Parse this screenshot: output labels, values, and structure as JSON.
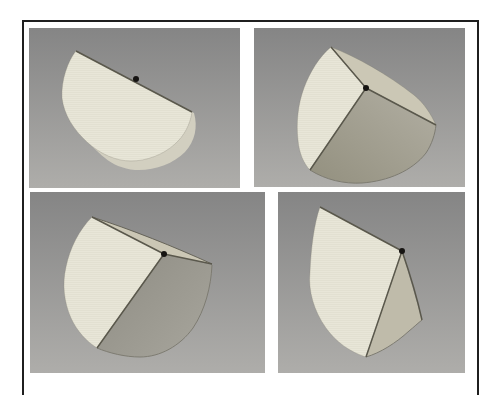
{
  "figure": {
    "panels": [
      {
        "id": "top-left",
        "stage": "disc folded flat in half",
        "marked_point": true
      },
      {
        "id": "top-right",
        "stage": "half-opened cone with three visible faces",
        "marked_point": true
      },
      {
        "id": "bottom-left",
        "stage": "disc with one sector folded upward",
        "marked_point": true
      },
      {
        "id": "bottom-right",
        "stage": "tightly folded narrow cone",
        "marked_point": true
      }
    ],
    "colors": {
      "page_bg": "#ffffff",
      "frame": "#1f1f1f",
      "panel_bg_top": "#858585",
      "panel_bg_bottom": "#aeadaa",
      "face_bright": "#ebe9db",
      "underside": "#d2cfc0",
      "flap_light": "#cbc7b5",
      "flap_mid": "#bfbbaa",
      "cone_inner_dark": "#93907f",
      "cone_inner_light": "#b2afa3",
      "back_half_dark": "#8e8c83",
      "back_half_light": "#a4a299",
      "fold_line": "#5a584c",
      "rim_line": "#7e7c72",
      "marker": "#161412"
    }
  }
}
